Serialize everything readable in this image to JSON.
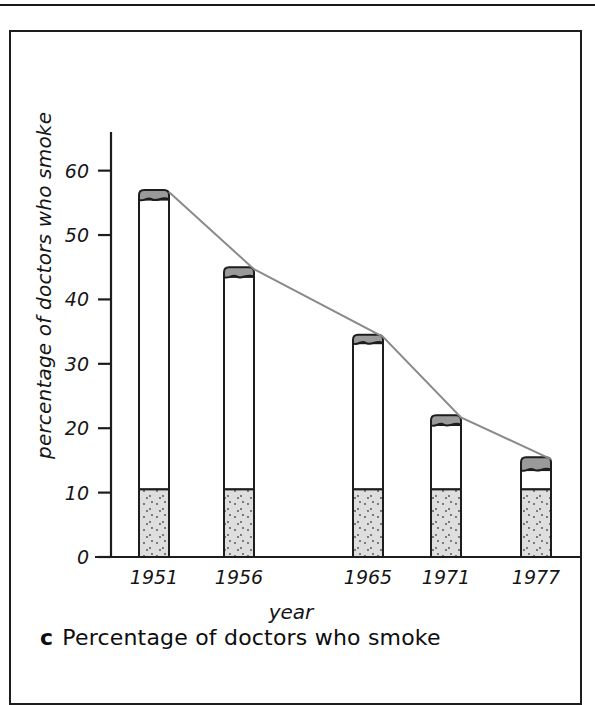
{
  "figure": {
    "caption_letter": "c",
    "caption_text": "Percentage of doctors who smoke"
  },
  "axis": {
    "y_title": "percentage of doctors who smoke",
    "x_title": "year"
  },
  "chart_data": {
    "type": "bar",
    "title": "Percentage of doctors who smoke",
    "xlabel": "year",
    "ylabel": "percentage of doctors who smoke",
    "categories": [
      "1951",
      "1956",
      "1965",
      "1971",
      "1977"
    ],
    "values": [
      57,
      45,
      34.5,
      22,
      15.5
    ],
    "series": [
      {
        "name": "percentage of doctors who smoke",
        "values": [
          57,
          45,
          34.5,
          22,
          15.5
        ]
      },
      {
        "name": "cigarette filter base",
        "values": [
          10.5,
          10.5,
          10.5,
          10.5,
          10.5
        ]
      },
      {
        "name": "cigarette paper body top",
        "values": [
          55.5,
          43.5,
          33.2,
          20.5,
          13.5
        ]
      }
    ],
    "ylim": [
      0,
      66
    ],
    "yticks": [
      0,
      10,
      20,
      30,
      40,
      50,
      60
    ],
    "ytick_labels": [
      "0",
      "10",
      "20",
      "30",
      "40",
      "50",
      "60"
    ],
    "grid": false,
    "legend": "none",
    "annotations": [
      "bars drawn as stylized cigarettes: speckled grey filter at base, white paper body, dark grey burning tip",
      "grey trend line connects the top of each cigarette"
    ]
  },
  "colors": {
    "axis": "#1d1d1d",
    "bar_outline": "#1d1d1d",
    "bar_body": "#ffffff",
    "filter_fill": "#dedede",
    "tip_fill": "#9a9a9a",
    "trend_line": "#8a8a8a",
    "frame": "#1d1d1d"
  }
}
